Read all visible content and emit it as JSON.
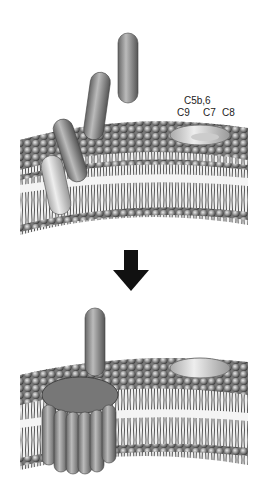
{
  "diagram": {
    "type": "membrane-attack-complex-formation",
    "panels": [
      {
        "id": "before",
        "labels": [
          "C5b,6",
          "C9",
          "C7",
          "C8"
        ]
      },
      {
        "id": "after",
        "labels": []
      }
    ],
    "arrow": "down-arrow",
    "colors": {
      "membrane": "#8a8a8a",
      "protein": "#9a9a9a",
      "complex_light": "#d8d8d8",
      "arrow": "#111111"
    }
  }
}
